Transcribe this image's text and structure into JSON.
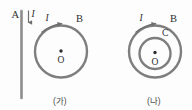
{
  "figure": {
    "stroke_color": "#7a7a7a",
    "label_color": "#2e2e2e",
    "caption_color": "#4a4a4a",
    "background": "#fdfdfd",
    "panels": [
      {
        "id": "panel-ga",
        "caption": "(가)",
        "elements": {
          "wire_label": "A",
          "wire_current_label": "I",
          "wire_current_direction": "downward",
          "loop_label": "B",
          "loop_current_label": "I",
          "loop_current_direction": "clockwise",
          "center_label": "O"
        }
      },
      {
        "id": "panel-na",
        "caption": "(나)",
        "elements": {
          "outer_loop_label": "B",
          "inner_loop_label": "C",
          "loop_current_label": "I",
          "loop_current_direction": "clockwise",
          "center_label": "O"
        }
      }
    ]
  }
}
